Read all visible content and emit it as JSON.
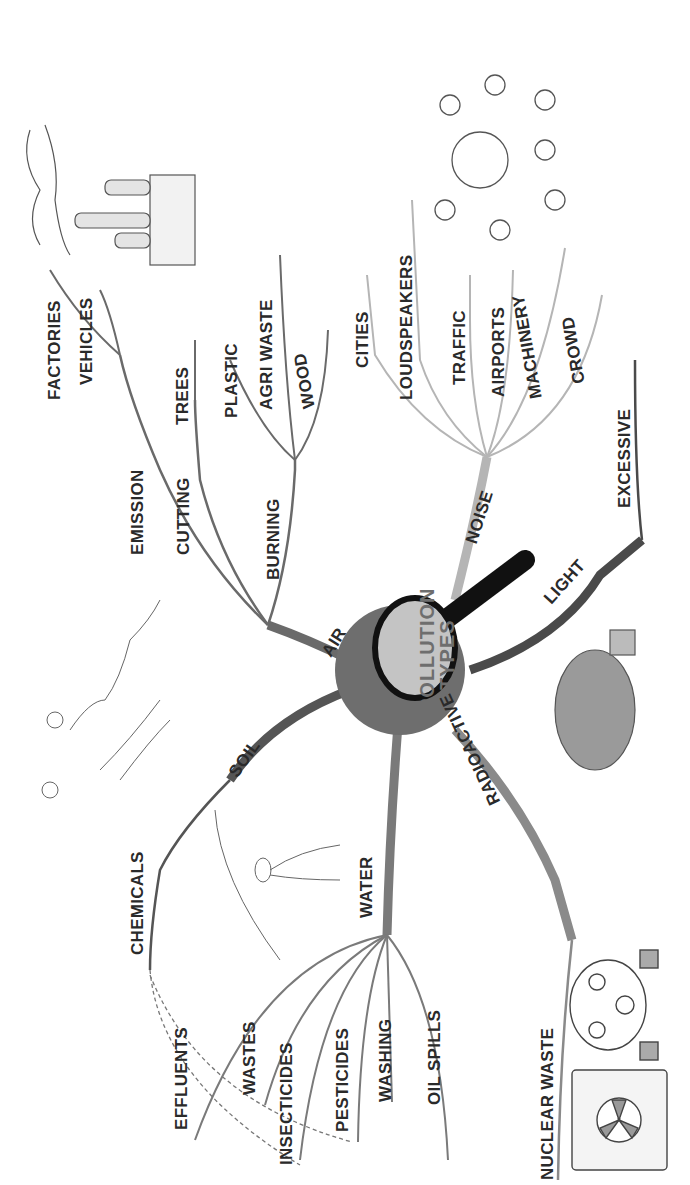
{
  "center": {
    "line1": "POLLUTION",
    "line2": "TYPES"
  },
  "branches": {
    "air": {
      "label": "AIR",
      "sub": {
        "emission": {
          "label": "EMISSION",
          "items": [
            "FACTORIES",
            "VEHICLES"
          ]
        },
        "cutting": {
          "label": "CUTTING",
          "items": [
            "TREES"
          ]
        },
        "burning": {
          "label": "BURNING",
          "items": [
            "PLASTIC",
            "AGRI WASTE",
            "WOOD"
          ]
        }
      }
    },
    "noise": {
      "label": "NOISE",
      "items": [
        "CITIES",
        "LOUDSPEAKERS",
        "TRAFFIC",
        "AIRPORTS",
        "MACHINERY",
        "CROWD"
      ]
    },
    "light": {
      "label": "LIGHT",
      "items": [
        "EXCESSIVE"
      ]
    },
    "soil": {
      "label": "SOIL",
      "items": [
        "CHEMICALS"
      ]
    },
    "water": {
      "label": "WATER",
      "items": [
        "EFFLUENTS",
        "WASTES",
        "INSECTICIDES",
        "PESTICIDES",
        "WASHING",
        "OIL SPILLS"
      ]
    },
    "radioactive": {
      "label": "RADIOACTIVE",
      "items": [
        "NUCLEAR WASTE"
      ]
    }
  },
  "illustrations": [
    "factory-smoke",
    "noisy-globe",
    "light-bulb",
    "gas-mask",
    "radioactive-barrel",
    "landscape",
    "water-pipe"
  ],
  "colors": {
    "air": "#6a6a6a",
    "noise": "#b5b5b5",
    "light": "#4a4a4a",
    "soil": "#555555",
    "water": "#7a7a7a",
    "radioactive": "#8a8a8a",
    "text": "#2a2a2a"
  }
}
